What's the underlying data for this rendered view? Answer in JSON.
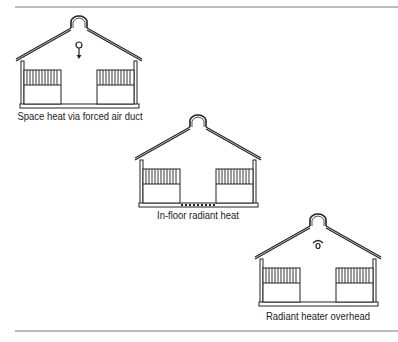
{
  "figure": {
    "colors": {
      "line": "#222222",
      "rule": "#777777",
      "background": "#ffffff"
    },
    "panels": [
      {
        "id": "forced-air",
        "caption": "Space heat via forced air duct",
        "heat_icon": "forced-air-duct-icon"
      },
      {
        "id": "in-floor",
        "caption": "In-floor radiant heat",
        "heat_icon": "in-floor-radiant-icon"
      },
      {
        "id": "overhead",
        "caption": "Radiant heater overhead",
        "heat_icon": "overhead-radiant-heater-icon"
      }
    ]
  }
}
